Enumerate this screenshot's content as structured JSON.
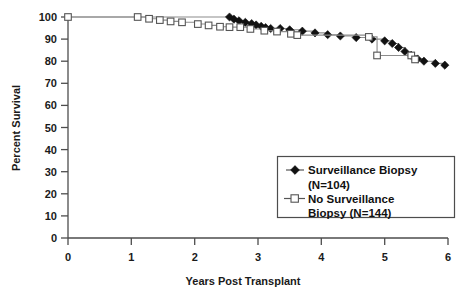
{
  "chart_data": {
    "type": "line",
    "title": "",
    "subtitle": "",
    "xlabel": "Years Post Transplant",
    "ylabel": "Percent Survival",
    "xlim": [
      0,
      6
    ],
    "ylim": [
      0,
      100
    ],
    "xticks": [
      "0",
      "1",
      "2",
      "3",
      "4",
      "5",
      "6"
    ],
    "yticks": [
      "0",
      "10",
      "20",
      "30",
      "40",
      "50",
      "60",
      "70",
      "80",
      "90",
      "100"
    ],
    "grid": false,
    "legend_position": "inside-lower-right",
    "series": [
      {
        "name": "Surveillance Biopsy",
        "legend_label": "Surveillance Biopsy",
        "legend_label_line2": "(N=104)",
        "n": 104,
        "marker": "filled-diamond",
        "color": "#111111",
        "points": [
          [
            0.0,
            100.0
          ],
          [
            2.55,
            100.0
          ],
          [
            2.62,
            99.0
          ],
          [
            2.7,
            98.3
          ],
          [
            2.8,
            97.6
          ],
          [
            2.9,
            97.0
          ],
          [
            2.97,
            96.4
          ],
          [
            3.05,
            95.8
          ],
          [
            3.12,
            95.2
          ],
          [
            3.2,
            94.8
          ],
          [
            3.35,
            94.8
          ],
          [
            3.5,
            94.2
          ],
          [
            3.7,
            93.6
          ],
          [
            3.9,
            92.8
          ],
          [
            4.1,
            92.0
          ],
          [
            4.3,
            91.4
          ],
          [
            4.55,
            90.7
          ],
          [
            4.8,
            90.0
          ],
          [
            5.0,
            89.2
          ],
          [
            5.12,
            88.0
          ],
          [
            5.22,
            86.2
          ],
          [
            5.32,
            84.4
          ],
          [
            5.42,
            82.6
          ],
          [
            5.52,
            81.0
          ],
          [
            5.62,
            80.0
          ],
          [
            5.8,
            79.0
          ],
          [
            5.95,
            78.2
          ]
        ]
      },
      {
        "name": "No Surveillance Biopsy",
        "legend_label": "No Surveillance",
        "legend_label_line2": "Biopsy  (N=144)",
        "n": 144,
        "marker": "open-square",
        "color": "#555555",
        "points": [
          [
            0.0,
            100.0
          ],
          [
            1.1,
            100.0
          ],
          [
            1.28,
            99.2
          ],
          [
            1.45,
            98.6
          ],
          [
            1.62,
            98.0
          ],
          [
            1.8,
            97.6
          ],
          [
            2.05,
            96.8
          ],
          [
            2.22,
            96.2
          ],
          [
            2.4,
            95.6
          ],
          [
            2.55,
            95.4
          ],
          [
            2.72,
            95.4
          ],
          [
            2.88,
            94.6
          ],
          [
            3.1,
            93.8
          ],
          [
            3.3,
            93.4
          ],
          [
            3.52,
            92.4
          ],
          [
            3.62,
            91.8
          ],
          [
            4.75,
            91.0
          ],
          [
            4.88,
            82.6
          ],
          [
            5.42,
            82.6
          ],
          [
            5.48,
            80.8
          ]
        ]
      }
    ]
  },
  "axes": {
    "x_title": "Years Post Transplant",
    "y_title": "Percent Survival"
  },
  "legend": {
    "entries": [
      {
        "label_line1": "Surveillance Biopsy",
        "label_line2": "(N=104)",
        "marker": "filled-diamond"
      },
      {
        "label_line1": "No Surveillance",
        "label_line2": "Biopsy  (N=144)",
        "marker": "open-square"
      }
    ]
  },
  "ticks": {
    "x": [
      "0",
      "1",
      "2",
      "3",
      "4",
      "5",
      "6"
    ],
    "y": [
      "100",
      "90",
      "80",
      "70",
      "60",
      "50",
      "40",
      "30",
      "20",
      "10",
      "0"
    ]
  },
  "colors": {
    "axis": "#4d4d4d",
    "text": "#1a1a1a",
    "series_surveillance": "#111111",
    "series_no_surveillance": "#555555",
    "background": "#ffffff"
  }
}
